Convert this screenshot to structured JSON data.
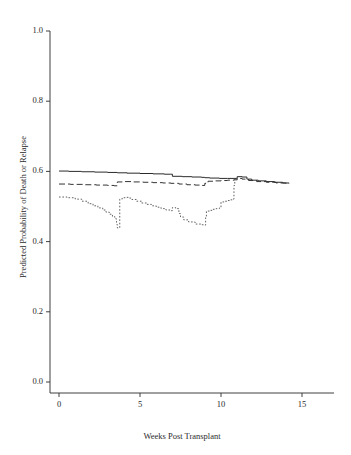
{
  "figure": {
    "background_color": "#ffffff",
    "line_color": "#2a2a2a",
    "width": 351,
    "height": 455
  },
  "chart_data": {
    "type": "line",
    "title": "",
    "subtitle": "",
    "xlabel": "Weeks Post Transplant",
    "ylabel": "Predicted Probability of Death or Relapse",
    "xlim": [
      -0.6,
      16.6
    ],
    "ylim": [
      0.0,
      1.04
    ],
    "xticks": [
      0,
      5,
      10,
      15
    ],
    "xtick_labels": [
      "0",
      "5",
      "10",
      "15"
    ],
    "yticks": [
      0.0,
      0.2,
      0.4,
      0.6,
      0.8,
      1.0
    ],
    "ytick_labels": [
      "0.0",
      "0.2",
      "0.4",
      "0.6",
      "0.8",
      "1.0"
    ],
    "grid": false,
    "legend": "none",
    "annotations": [],
    "series": [
      {
        "name": "solid-curve",
        "style": "solid",
        "dash": "none",
        "color": "#2a2a2a",
        "x": [
          0.0,
          0.6,
          1.4,
          2.2,
          3.0,
          3.6,
          4.2,
          5.0,
          5.8,
          6.5,
          6.9,
          7.0,
          7.6,
          8.2,
          8.8,
          9.0,
          9.3,
          9.9,
          10.4,
          10.8,
          11.0,
          11.3,
          11.6,
          11.9,
          12.3,
          12.8,
          13.3,
          13.8,
          14.2
        ],
        "y": [
          0.601,
          0.6,
          0.599,
          0.598,
          0.597,
          0.596,
          0.595,
          0.594,
          0.593,
          0.592,
          0.592,
          0.586,
          0.585,
          0.584,
          0.583,
          0.582,
          0.581,
          0.58,
          0.58,
          0.58,
          0.585,
          0.584,
          0.578,
          0.575,
          0.573,
          0.571,
          0.569,
          0.567,
          0.566
        ]
      },
      {
        "name": "dashed-curve",
        "style": "dashed",
        "dash": "6,3",
        "color": "#2a2a2a",
        "x": [
          0.0,
          0.7,
          1.5,
          2.3,
          3.0,
          3.4,
          3.6,
          4.0,
          4.6,
          5.2,
          5.8,
          6.4,
          6.9,
          7.4,
          7.9,
          8.4,
          8.8,
          9.0,
          9.2,
          9.6,
          10.0,
          10.4,
          10.8,
          11.0,
          11.3,
          11.7,
          12.2,
          12.8,
          13.4,
          14.0,
          14.2
        ],
        "y": [
          0.564,
          0.563,
          0.562,
          0.561,
          0.56,
          0.559,
          0.57,
          0.571,
          0.57,
          0.569,
          0.568,
          0.567,
          0.566,
          0.564,
          0.562,
          0.561,
          0.56,
          0.566,
          0.572,
          0.573,
          0.574,
          0.575,
          0.576,
          0.58,
          0.578,
          0.574,
          0.571,
          0.569,
          0.567,
          0.566,
          0.566
        ]
      },
      {
        "name": "dotted-curve",
        "style": "dotted",
        "dash": "1.6,1.8",
        "color": "#5a5a5a",
        "x": [
          0.0,
          0.5,
          1.0,
          1.4,
          1.8,
          2.1,
          2.4,
          2.7,
          2.9,
          3.1,
          3.3,
          3.45,
          3.55,
          3.58,
          3.6,
          3.75,
          3.9,
          4.1,
          4.3,
          4.5,
          4.8,
          5.1,
          5.4,
          5.7,
          6.0,
          6.3,
          6.6,
          6.9,
          7.0,
          7.2,
          7.4,
          7.5,
          7.7,
          8.0,
          8.4,
          8.8,
          9.0,
          9.05,
          9.1,
          9.3,
          9.5,
          9.7,
          9.9,
          10.0,
          10.2,
          10.4,
          10.6,
          10.75,
          10.8,
          10.85,
          11.0
        ],
        "y": [
          0.527,
          0.525,
          0.521,
          0.515,
          0.508,
          0.502,
          0.496,
          0.49,
          0.484,
          0.478,
          0.471,
          0.465,
          0.455,
          0.448,
          0.439,
          0.521,
          0.525,
          0.526,
          0.524,
          0.52,
          0.515,
          0.51,
          0.506,
          0.502,
          0.498,
          0.494,
          0.49,
          0.488,
          0.497,
          0.494,
          0.48,
          0.47,
          0.462,
          0.456,
          0.45,
          0.448,
          0.447,
          0.468,
          0.487,
          0.489,
          0.492,
          0.494,
          0.496,
          0.513,
          0.515,
          0.517,
          0.519,
          0.521,
          0.56,
          0.58,
          0.581
        ]
      }
    ]
  },
  "axes": {
    "x_axis_name": "x-axis",
    "y_axis_name": "y-axis"
  }
}
